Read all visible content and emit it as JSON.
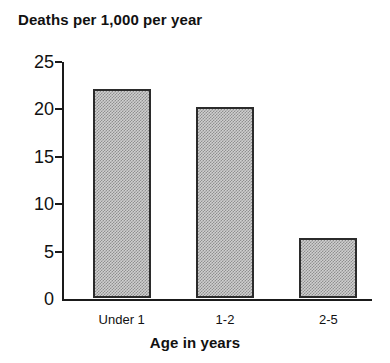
{
  "chart_data": {
    "type": "bar",
    "title": "Deaths per 1,000 per year",
    "xlabel": "Age in years",
    "ylabel": "",
    "categories": [
      "Under 1",
      "1-2",
      "2-5"
    ],
    "values": [
      22.0,
      20.2,
      6.3
    ],
    "ylim": [
      0,
      25
    ],
    "yticks": [
      0,
      5,
      10,
      15,
      20,
      25
    ],
    "ytick_labels": [
      "0",
      "5",
      "10",
      "15",
      "20",
      "25"
    ],
    "grid": false,
    "legend": false,
    "bar_fill_color": "#cfcfcf",
    "bar_edge_color": "#2b2b2b",
    "background_color": "#ffffff",
    "text_color": "#111111"
  }
}
